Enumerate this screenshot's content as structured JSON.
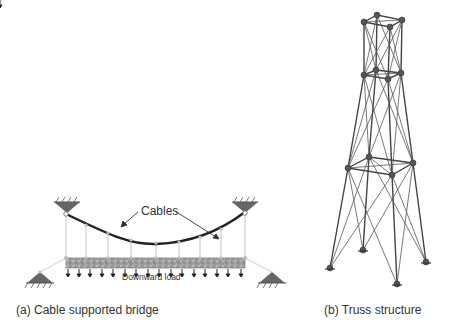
{
  "panel_a": {
    "caption": "(a) Cable supported bridge",
    "cables_label": "Cables",
    "load_label": "Downward load"
  },
  "panel_b": {
    "caption": "(b) Truss structure"
  },
  "colors": {
    "cable": "#222222",
    "hanger": "#cccccc",
    "support": "#666666",
    "truss": "#444444",
    "node": "#555555",
    "text": "#333333"
  }
}
